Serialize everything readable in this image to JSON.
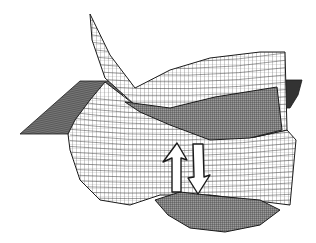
{
  "figure": {
    "width": 316,
    "height": 243,
    "background": "#ffffff",
    "ink": "#1a1a1a",
    "colors": {
      "mesh_light": "#555555",
      "mesh_dark": "#222222",
      "shade_dense": "#6a6a6a",
      "shade_plane": "#4a4a4a",
      "arrow_fill": "#ffffff",
      "arrow_stroke": "#1a1a1a"
    },
    "left_plane": [
      [
        20,
        134
      ],
      [
        80,
        81
      ],
      [
        130,
        81
      ],
      [
        125,
        93
      ],
      [
        68,
        134
      ]
    ],
    "right_plane": [
      [
        285,
        80
      ],
      [
        302,
        80
      ],
      [
        298,
        95
      ],
      [
        290,
        108
      ],
      [
        285,
        108
      ]
    ],
    "upper_surface": {
      "outline": [
        [
          90,
          14
        ],
        [
          110,
          55
        ],
        [
          135,
          88
        ],
        [
          170,
          70
        ],
        [
          210,
          58
        ],
        [
          260,
          52
        ],
        [
          285,
          52
        ],
        [
          287,
          130
        ],
        [
          255,
          137
        ],
        [
          215,
          138
        ],
        [
          175,
          125
        ],
        [
          135,
          105
        ],
        [
          105,
          78
        ],
        [
          92,
          40
        ]
      ],
      "dense_band": [
        [
          125,
          102
        ],
        [
          170,
          108
        ],
        [
          215,
          97
        ],
        [
          277,
          87
        ],
        [
          282,
          130
        ],
        [
          250,
          138
        ],
        [
          210,
          140
        ],
        [
          170,
          125
        ],
        [
          140,
          112
        ]
      ]
    },
    "lower_surface": {
      "outline": [
        [
          68,
          134
        ],
        [
          70,
          150
        ],
        [
          80,
          180
        ],
        [
          100,
          200
        ],
        [
          130,
          205
        ],
        [
          160,
          195
        ],
        [
          185,
          195
        ],
        [
          210,
          195
        ],
        [
          250,
          200
        ],
        [
          290,
          205
        ],
        [
          296,
          140
        ],
        [
          287,
          130
        ],
        [
          255,
          137
        ],
        [
          215,
          138
        ],
        [
          175,
          125
        ],
        [
          135,
          105
        ],
        [
          105,
          82
        ],
        [
          90,
          100
        ],
        [
          75,
          120
        ]
      ],
      "dense_well": [
        [
          155,
          200
        ],
        [
          180,
          192
        ],
        [
          215,
          196
        ],
        [
          260,
          200
        ],
        [
          280,
          210
        ],
        [
          260,
          225
        ],
        [
          225,
          232
        ],
        [
          190,
          228
        ],
        [
          168,
          215
        ]
      ]
    },
    "arrows": [
      {
        "name": "excitation-arrow",
        "direction": "up",
        "points": [
          [
            172,
            192
          ],
          [
            172,
            158
          ],
          [
            163,
            162
          ],
          [
            177,
            143
          ],
          [
            187,
            160
          ],
          [
            181,
            158
          ],
          [
            181,
            192
          ]
        ]
      },
      {
        "name": "emission-arrow",
        "direction": "down",
        "points": [
          [
            193,
            144
          ],
          [
            203,
            144
          ],
          [
            204,
            177
          ],
          [
            210,
            175
          ],
          [
            198,
            194
          ],
          [
            188,
            178
          ],
          [
            194,
            177
          ]
        ]
      }
    ]
  }
}
